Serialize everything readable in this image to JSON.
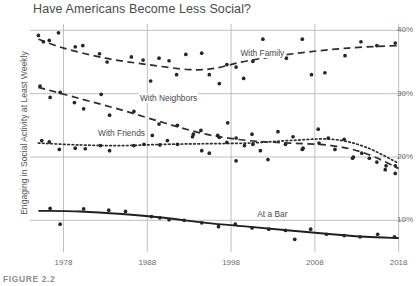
{
  "chart_data": {
    "type": "scatter",
    "title": "Have Americans Become Less Social?",
    "xlabel": "",
    "ylabel": "Engaging in Social Activity at Least Weekly",
    "xlim": [
      1974,
      2019
    ],
    "ylim": [
      5,
      41
    ],
    "grid": true,
    "legend_position": "inline-labels",
    "x_ticks": [
      "1978",
      "1988",
      "1998",
      "2008",
      "2018"
    ],
    "x_tick_values": [
      1978,
      1988,
      1998,
      2008,
      2018
    ],
    "y_ticks": [
      "10%",
      "20%",
      "30%",
      "40%"
    ],
    "y_tick_values": [
      10,
      20,
      30,
      40
    ],
    "caption": "FIGURE 2.2",
    "series": [
      {
        "name": "With Family",
        "label": "With Family",
        "line_style": "dashed",
        "color": "#2e2e2e",
        "label_x": 1999,
        "label_y": 36.3,
        "trend": [
          {
            "x": 1975,
            "y": 38.6
          },
          {
            "x": 1978,
            "y": 37.2
          },
          {
            "x": 1983,
            "y": 35.6
          },
          {
            "x": 1988,
            "y": 34.6
          },
          {
            "x": 1993,
            "y": 33.8
          },
          {
            "x": 1996,
            "y": 34.0
          },
          {
            "x": 2000,
            "y": 35.2
          },
          {
            "x": 2006,
            "y": 36.4
          },
          {
            "x": 2012,
            "y": 37.2
          },
          {
            "x": 2018,
            "y": 37.6
          }
        ],
        "points": [
          {
            "x": 1975,
            "y": 39.2
          },
          {
            "x": 1975.6,
            "y": 38.2
          },
          {
            "x": 1976.3,
            "y": 38.4
          },
          {
            "x": 1977.4,
            "y": 39.6
          },
          {
            "x": 1979.4,
            "y": 37.4
          },
          {
            "x": 1980.3,
            "y": 37.6
          },
          {
            "x": 1982.3,
            "y": 36.3
          },
          {
            "x": 1983.2,
            "y": 35.0
          },
          {
            "x": 1986.1,
            "y": 35.8
          },
          {
            "x": 1987.5,
            "y": 35.3
          },
          {
            "x": 1988.4,
            "y": 32.0
          },
          {
            "x": 1989.4,
            "y": 35.6
          },
          {
            "x": 1990.6,
            "y": 35.2
          },
          {
            "x": 1991.5,
            "y": 33.0
          },
          {
            "x": 1992.6,
            "y": 36.2
          },
          {
            "x": 1994.5,
            "y": 36.4
          },
          {
            "x": 1995.4,
            "y": 33.0
          },
          {
            "x": 1996.6,
            "y": 31.6
          },
          {
            "x": 1997.5,
            "y": 34.6
          },
          {
            "x": 1998.6,
            "y": 34.2
          },
          {
            "x": 1999.5,
            "y": 32.4
          },
          {
            "x": 2000.6,
            "y": 35.1
          },
          {
            "x": 2001.8,
            "y": 38.6
          },
          {
            "x": 2003.4,
            "y": 36.1
          },
          {
            "x": 2004.6,
            "y": 35.6
          },
          {
            "x": 2006.5,
            "y": 38.6
          },
          {
            "x": 2007.6,
            "y": 33.0
          },
          {
            "x": 2009.2,
            "y": 33.3
          },
          {
            "x": 2011.6,
            "y": 36.0
          },
          {
            "x": 2013.5,
            "y": 38.2
          },
          {
            "x": 2015.4,
            "y": 37.6
          },
          {
            "x": 2017.6,
            "y": 38.0
          }
        ]
      },
      {
        "name": "With Neighbors",
        "label": "With Neighbors",
        "line_style": "dashed",
        "color": "#2e2e2e",
        "label_x": 1987,
        "label_y": 29.1,
        "trend": [
          {
            "x": 1975,
            "y": 31.0
          },
          {
            "x": 1980,
            "y": 29.2
          },
          {
            "x": 1985,
            "y": 27.4
          },
          {
            "x": 1990,
            "y": 25.4
          },
          {
            "x": 1995,
            "y": 23.6
          },
          {
            "x": 2000,
            "y": 22.6
          },
          {
            "x": 2005,
            "y": 22.2
          },
          {
            "x": 2010,
            "y": 21.8
          },
          {
            "x": 2014,
            "y": 20.6
          },
          {
            "x": 2018,
            "y": 18.2
          }
        ],
        "points": [
          {
            "x": 1975.2,
            "y": 31.2
          },
          {
            "x": 1976.4,
            "y": 29.4
          },
          {
            "x": 1977.6,
            "y": 30.2
          },
          {
            "x": 1979.3,
            "y": 28.6
          },
          {
            "x": 1980.4,
            "y": 27.6
          },
          {
            "x": 1982.5,
            "y": 29.9
          },
          {
            "x": 1983.5,
            "y": 26.6
          },
          {
            "x": 1986.4,
            "y": 27.2
          },
          {
            "x": 1988.5,
            "y": 29.4
          },
          {
            "x": 1989.4,
            "y": 25.2
          },
          {
            "x": 1991.6,
            "y": 25.0
          },
          {
            "x": 1993.5,
            "y": 23.6
          },
          {
            "x": 1994.4,
            "y": 24.2
          },
          {
            "x": 1996.4,
            "y": 23.4
          },
          {
            "x": 1997.6,
            "y": 25.4
          },
          {
            "x": 1998.6,
            "y": 23.0
          },
          {
            "x": 1999.6,
            "y": 21.8
          },
          {
            "x": 2000.6,
            "y": 22.0
          },
          {
            "x": 2002.4,
            "y": 19.6
          },
          {
            "x": 2004.5,
            "y": 22.0
          },
          {
            "x": 2006.6,
            "y": 21.4
          },
          {
            "x": 2008.5,
            "y": 22.2
          },
          {
            "x": 2010.4,
            "y": 21.2
          },
          {
            "x": 2012.5,
            "y": 19.8
          },
          {
            "x": 2013.6,
            "y": 20.6
          },
          {
            "x": 2015.4,
            "y": 19.2
          },
          {
            "x": 2016.4,
            "y": 18.0
          },
          {
            "x": 2017.6,
            "y": 17.4
          }
        ]
      },
      {
        "name": "With Friends",
        "label": "With Friends",
        "line_style": "dotted",
        "color": "#2e2e2e",
        "label_x": 1982,
        "label_y": 23.6,
        "trend": [
          {
            "x": 1975,
            "y": 22.2
          },
          {
            "x": 1980,
            "y": 21.9
          },
          {
            "x": 1985,
            "y": 21.8
          },
          {
            "x": 1990,
            "y": 22.0
          },
          {
            "x": 1995,
            "y": 22.1
          },
          {
            "x": 2000,
            "y": 22.2
          },
          {
            "x": 2005,
            "y": 22.6
          },
          {
            "x": 2010,
            "y": 22.8
          },
          {
            "x": 2014,
            "y": 21.6
          },
          {
            "x": 2018,
            "y": 19.0
          }
        ],
        "points": [
          {
            "x": 1975.4,
            "y": 22.6
          },
          {
            "x": 1976.3,
            "y": 22.4
          },
          {
            "x": 1977.5,
            "y": 21.2
          },
          {
            "x": 1979.4,
            "y": 21.4
          },
          {
            "x": 1980.6,
            "y": 21.3
          },
          {
            "x": 1982.4,
            "y": 21.8
          },
          {
            "x": 1983.5,
            "y": 21.0
          },
          {
            "x": 1986.4,
            "y": 21.8
          },
          {
            "x": 1987.6,
            "y": 22.0
          },
          {
            "x": 1988.6,
            "y": 23.4
          },
          {
            "x": 1989.5,
            "y": 21.9
          },
          {
            "x": 1990.4,
            "y": 22.6
          },
          {
            "x": 1991.6,
            "y": 22.0
          },
          {
            "x": 1993.4,
            "y": 23.2
          },
          {
            "x": 1994.5,
            "y": 21.0
          },
          {
            "x": 1995.4,
            "y": 20.6
          },
          {
            "x": 1996.6,
            "y": 23.1
          },
          {
            "x": 1997.5,
            "y": 22.3
          },
          {
            "x": 1998.6,
            "y": 19.4
          },
          {
            "x": 2000.5,
            "y": 23.6
          },
          {
            "x": 2001.5,
            "y": 21.0
          },
          {
            "x": 2003.6,
            "y": 24.0
          },
          {
            "x": 2005.4,
            "y": 23.2
          },
          {
            "x": 2006.5,
            "y": 21.2
          },
          {
            "x": 2008.4,
            "y": 24.4
          },
          {
            "x": 2009.6,
            "y": 23.0
          },
          {
            "x": 2011.5,
            "y": 22.8
          },
          {
            "x": 2012.6,
            "y": 20.0
          },
          {
            "x": 2014.5,
            "y": 19.8
          },
          {
            "x": 2016.5,
            "y": 18.6
          },
          {
            "x": 2017.6,
            "y": 18.6
          }
        ]
      },
      {
        "name": "At a Bar",
        "label": "At a Bar",
        "line_style": "solid",
        "color": "#1f1f1f",
        "label_x": 2001,
        "label_y": 10.8,
        "trend": [
          {
            "x": 1975,
            "y": 11.5
          },
          {
            "x": 1980,
            "y": 11.4
          },
          {
            "x": 1985,
            "y": 11.0
          },
          {
            "x": 1990,
            "y": 10.4
          },
          {
            "x": 1995,
            "y": 9.6
          },
          {
            "x": 2000,
            "y": 9.0
          },
          {
            "x": 2005,
            "y": 8.4
          },
          {
            "x": 2010,
            "y": 7.8
          },
          {
            "x": 2014,
            "y": 7.4
          },
          {
            "x": 2018,
            "y": 7.2
          }
        ],
        "points": [
          {
            "x": 1976.4,
            "y": 11.9
          },
          {
            "x": 1977.6,
            "y": 9.4
          },
          {
            "x": 1980.4,
            "y": 11.8
          },
          {
            "x": 1983.4,
            "y": 11.6
          },
          {
            "x": 1985.4,
            "y": 11.4
          },
          {
            "x": 1988.5,
            "y": 10.6
          },
          {
            "x": 1989.5,
            "y": 10.4
          },
          {
            "x": 1990.6,
            "y": 10.1
          },
          {
            "x": 1992.4,
            "y": 10.0
          },
          {
            "x": 1994.5,
            "y": 9.6
          },
          {
            "x": 1996.5,
            "y": 9.0
          },
          {
            "x": 1998.5,
            "y": 9.4
          },
          {
            "x": 2000.5,
            "y": 8.8
          },
          {
            "x": 2002.5,
            "y": 8.6
          },
          {
            "x": 2004.5,
            "y": 8.4
          },
          {
            "x": 2005.6,
            "y": 7.0
          },
          {
            "x": 2007.5,
            "y": 8.6
          },
          {
            "x": 2009.4,
            "y": 7.8
          },
          {
            "x": 2011.5,
            "y": 7.6
          },
          {
            "x": 2013.4,
            "y": 7.4
          },
          {
            "x": 2015.5,
            "y": 7.8
          },
          {
            "x": 2017.5,
            "y": 7.4
          }
        ]
      }
    ]
  }
}
